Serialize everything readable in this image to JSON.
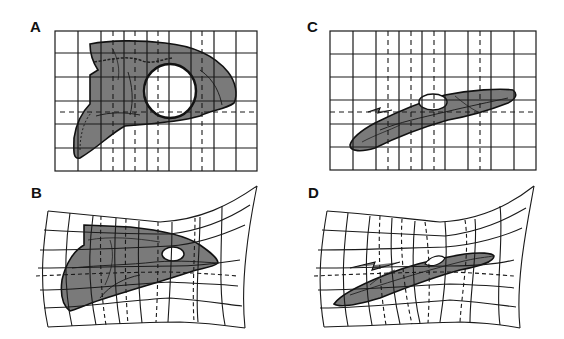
{
  "figure": {
    "colors": {
      "grid_line": "#1a1a1a",
      "skull_fill": "#7a7a7a",
      "skull_outline": "#111111",
      "background": "#ffffff",
      "fenestra": "#ffffff"
    },
    "panels": [
      {
        "id": "A",
        "label": "A",
        "description": "Skull on regular rectangular grid (lateral view, short deep skull)",
        "grid": "regular",
        "columns": 10,
        "rows": 7
      },
      {
        "id": "B",
        "label": "B",
        "description": "Deformed grid mapping skull A onto elongated shape",
        "grid": "warped"
      },
      {
        "id": "C",
        "label": "C",
        "description": "Elongated low skull on regular rectangular grid",
        "grid": "regular",
        "columns": 10,
        "rows": 7
      },
      {
        "id": "D",
        "label": "D",
        "description": "Deformed grid mapping skull C to elongated shape",
        "grid": "warped"
      }
    ]
  }
}
